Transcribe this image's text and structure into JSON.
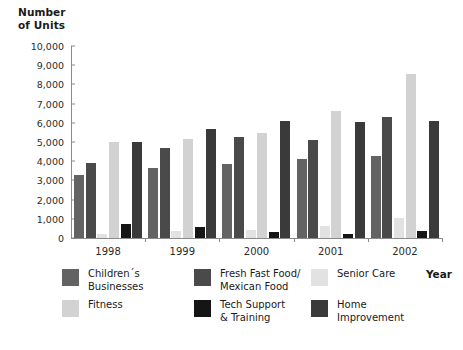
{
  "chart_data": {
    "type": "bar",
    "title": "",
    "ylabel": "Number of Units",
    "xlabel": "Year",
    "ylim": [
      0,
      10000
    ],
    "ytick_labels": [
      "10,000",
      "9,000",
      "8,000",
      "7,000",
      "6,000",
      "5,000",
      "4,000",
      "3,000",
      "2,000",
      "1,000",
      "0"
    ],
    "ytick_values": [
      10000,
      9000,
      8000,
      7000,
      6000,
      5000,
      4000,
      3000,
      2000,
      1000,
      0
    ],
    "grid": false,
    "legend_position": "bottom",
    "categories": [
      "1998",
      "1999",
      "2000",
      "2001",
      "2002"
    ],
    "series": [
      {
        "name": "Children's\nBusinesses",
        "label_line1": "Children´s",
        "label_line2": "Businesses",
        "color": "#636363",
        "values": [
          3300,
          3650,
          3850,
          4100,
          4250
        ]
      },
      {
        "name": "Fresh Fast Food/ Mexican Food",
        "label_line1": "Fresh Fast Food/",
        "label_line2": "Mexican Food",
        "color": "#4a4a4a",
        "values": [
          3900,
          4700,
          5250,
          5100,
          6300
        ]
      },
      {
        "name": "Senior Care",
        "label_line1": "Senior Care",
        "label_line2": "",
        "color": "#e2e2e2",
        "values": [
          200,
          350,
          400,
          600,
          1050
        ]
      },
      {
        "name": "Fitness",
        "label_line1": "Fitness",
        "label_line2": "",
        "color": "#d2d2d2",
        "values": [
          5000,
          5150,
          5450,
          6600,
          8550
        ]
      },
      {
        "name": "Tech Support & Training",
        "label_line1": "Tech Support",
        "label_line2": "& Training",
        "color": "#151515",
        "values": [
          750,
          550,
          330,
          200,
          350
        ]
      },
      {
        "name": "Home Improvement",
        "label_line1": "Home",
        "label_line2": "Improvement",
        "color": "#3a3a3a",
        "values": [
          5000,
          5700,
          6100,
          6050,
          6100
        ]
      }
    ]
  },
  "axis": {
    "y_title_line1": "Number",
    "y_title_line2": "of Units",
    "x_title": "Year"
  }
}
